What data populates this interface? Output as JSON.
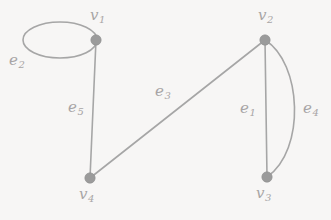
{
  "figure": {
    "type": "undirected-multigraph-diagram",
    "background_color": "#f7f6f5",
    "stroke_color": "#a6a6a6",
    "vertex_color": "#9b9b9b",
    "label_color": "#a8a5a5"
  },
  "graph_data": {
    "type": "graph",
    "vertices": [
      {
        "id": "v1",
        "label_base": "v",
        "label_sub": "1",
        "x": 96,
        "y": 40
      },
      {
        "id": "v2",
        "label_base": "v",
        "label_sub": "2",
        "x": 265,
        "y": 40
      },
      {
        "id": "v3",
        "label_base": "v",
        "label_sub": "3",
        "x": 267,
        "y": 177
      },
      {
        "id": "v4",
        "label_base": "v",
        "label_sub": "4",
        "x": 90,
        "y": 178
      }
    ],
    "edges": [
      {
        "id": "e1",
        "label_base": "e",
        "label_sub": "1",
        "from": "v2",
        "to": "v3",
        "shape": "straight"
      },
      {
        "id": "e2",
        "label_base": "e",
        "label_sub": "2",
        "from": "v1",
        "to": "v1",
        "shape": "self-loop"
      },
      {
        "id": "e3",
        "label_base": "e",
        "label_sub": "3",
        "from": "v4",
        "to": "v2",
        "shape": "straight"
      },
      {
        "id": "e4",
        "label_base": "e",
        "label_sub": "4",
        "from": "v2",
        "to": "v3",
        "shape": "curved-right"
      },
      {
        "id": "e5",
        "label_base": "e",
        "label_sub": "5",
        "from": "v1",
        "to": "v4",
        "shape": "straight"
      }
    ],
    "vertex_labels": {
      "v1": {
        "text": "v1",
        "base": "v",
        "sub": "1",
        "x": 90,
        "y": 8
      },
      "v2": {
        "text": "v2",
        "base": "v",
        "sub": "2",
        "x": 258,
        "y": 8
      },
      "v3": {
        "text": "v3",
        "base": "v",
        "sub": "3",
        "x": 256,
        "y": 186
      },
      "v4": {
        "text": "v4",
        "base": "v",
        "sub": "4",
        "x": 79,
        "y": 187
      }
    },
    "edge_labels": {
      "e1": {
        "text": "e1",
        "base": "e",
        "sub": "1",
        "x": 240,
        "y": 101
      },
      "e2": {
        "text": "e2",
        "base": "e",
        "sub": "2",
        "x": 9,
        "y": 53
      },
      "e3": {
        "text": "e3",
        "base": "e",
        "sub": "3",
        "x": 155,
        "y": 84
      },
      "e4": {
        "text": "e4",
        "base": "e",
        "sub": "4",
        "x": 303,
        "y": 101
      },
      "e5": {
        "text": "e5",
        "base": "e",
        "sub": "5",
        "x": 68,
        "y": 100
      }
    }
  }
}
